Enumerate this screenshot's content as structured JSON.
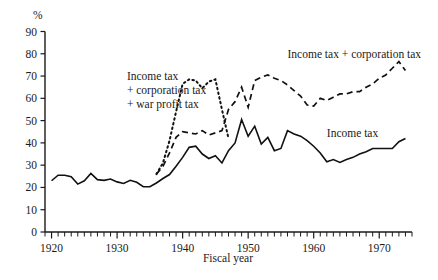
{
  "chart_data": {
    "type": "line",
    "title": "",
    "xlabel": "Fiscal year",
    "ylabel": "",
    "unit_label": "%",
    "xlim": [
      1919,
      1975
    ],
    "ylim": [
      0,
      90
    ],
    "grid": false,
    "legend_position": "inline-annotations",
    "x_ticks_major": [
      1920,
      1930,
      1940,
      1950,
      1960,
      1970
    ],
    "x_tick_labels": [
      "1920",
      "1930",
      "1940",
      "1950",
      "1960",
      "1970"
    ],
    "x_tick_interval_minor": 1,
    "y_ticks": [
      0,
      10,
      20,
      30,
      40,
      50,
      60,
      70,
      80,
      90
    ],
    "y_tick_labels": [
      "0",
      "10",
      "20",
      "30",
      "40",
      "50",
      "60",
      "70",
      "80",
      "90"
    ],
    "series": [
      {
        "name": "Income tax",
        "style": "solid",
        "label_text": "Income tax",
        "label_x": 1962.0,
        "label_y": 42.5,
        "x": [
          1920,
          1921,
          1922,
          1923,
          1924,
          1925,
          1926,
          1927,
          1928,
          1929,
          1930,
          1931,
          1932,
          1933,
          1934,
          1935,
          1936,
          1937,
          1938,
          1939,
          1940,
          1941,
          1942,
          1943,
          1944,
          1945,
          1946,
          1947,
          1948,
          1949,
          1950,
          1951,
          1952,
          1953,
          1954,
          1955,
          1956,
          1957,
          1958,
          1959,
          1960,
          1961,
          1962,
          1963,
          1964,
          1965,
          1966,
          1967,
          1968,
          1969,
          1970,
          1971,
          1972,
          1973,
          1974
        ],
        "values": [
          23.0,
          25.5,
          25.5,
          24.8,
          21.5,
          23.0,
          26.3,
          23.5,
          23.2,
          23.8,
          22.5,
          21.8,
          23.2,
          22.3,
          20.3,
          20.3,
          22.0,
          24.0,
          25.8,
          29.5,
          33.5,
          38.0,
          38.5,
          35.0,
          33.0,
          34.2,
          31.0,
          36.5,
          40.0,
          50.5,
          43.0,
          47.5,
          39.5,
          42.5,
          36.5,
          37.5,
          45.5,
          44.0,
          43.0,
          41.0,
          38.5,
          35.5,
          31.5,
          32.5,
          31.2,
          32.5,
          33.5,
          35.0,
          36.0,
          37.5,
          37.5,
          37.5,
          37.5,
          40.5,
          42.0
        ]
      },
      {
        "name": "Income tax + corporation tax",
        "style": "dashed",
        "label_text": "Income tax + corporation tax",
        "label_x": 1956.0,
        "label_y": 78.0,
        "x": [
          1936,
          1937,
          1938,
          1939,
          1940,
          1941,
          1942,
          1943,
          1944,
          1945,
          1946,
          1947,
          1948,
          1949,
          1950,
          1951,
          1952,
          1953,
          1954,
          1955,
          1956,
          1957,
          1958,
          1959,
          1960,
          1961,
          1962,
          1963,
          1964,
          1965,
          1966,
          1967,
          1968,
          1969,
          1970,
          1971,
          1972,
          1973,
          1974
        ],
        "values": [
          26.0,
          29.5,
          35.5,
          42.5,
          45.0,
          44.5,
          44.0,
          45.5,
          43.5,
          44.5,
          45.5,
          55.0,
          58.5,
          65.0,
          56.0,
          68.0,
          69.5,
          70.5,
          69.0,
          68.0,
          66.0,
          63.5,
          61.0,
          57.0,
          56.5,
          60.0,
          59.0,
          60.5,
          62.0,
          62.0,
          63.0,
          63.0,
          65.0,
          66.5,
          69.0,
          70.5,
          73.5,
          76.5,
          72.5
        ]
      },
      {
        "name": "Income tax + corporation tax + war profit tax",
        "style": "dotted",
        "label_text": "Income tax\n+ corporation tax\n+ war profit tax",
        "label_lines": [
          "Income tax",
          "+ corporation tax",
          "+ war profit tax"
        ],
        "label_x": 1931.5,
        "label_y": 62.0,
        "x": [
          1936,
          1937,
          1938,
          1939,
          1940,
          1941,
          1942,
          1943,
          1944,
          1945,
          1946,
          1947
        ],
        "values": [
          26.0,
          31.0,
          41.0,
          54.0,
          66.5,
          68.5,
          68.0,
          64.5,
          67.5,
          68.5,
          55.0,
          42.0
        ]
      }
    ]
  },
  "annotations": {
    "y_axis_unit": "%",
    "x_axis_title": "Fiscal year",
    "series_label_income_tax": "Income tax",
    "series_label_income_corp": "Income tax + corporation tax",
    "series_label_war_line1": "Income tax",
    "series_label_war_line2": "+ corporation tax",
    "series_label_war_line3": "+ war profit tax"
  },
  "colors": {
    "ink": "#111111",
    "background": "#ffffff"
  }
}
